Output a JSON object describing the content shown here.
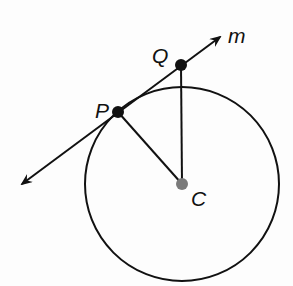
{
  "diagram": {
    "title": "",
    "labels": {
      "line": "m",
      "point_q": "Q",
      "point_p": "P",
      "center": "C"
    },
    "colors": {
      "stroke": "#111111",
      "center_dot": "#7a7a7a"
    },
    "elements": [
      {
        "type": "circle",
        "center": "C",
        "passes_through": "P"
      },
      {
        "type": "line",
        "name": "m",
        "through": [
          "P",
          "Q"
        ],
        "tangent_to_circle_at": "P"
      },
      {
        "type": "segment",
        "from": "P",
        "to": "C"
      },
      {
        "type": "segment",
        "from": "Q",
        "to": "C"
      }
    ]
  }
}
